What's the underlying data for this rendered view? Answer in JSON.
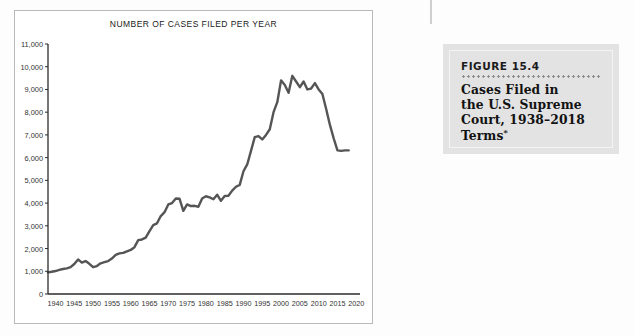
{
  "figure": {
    "number_label": "FIGURE 15.4",
    "title_line1": "Cases Filed in",
    "title_line2": "the U.S. Supreme",
    "title_line3": "Court, 1938–2018",
    "title_line4": "Terms",
    "title_footnote_marker": "*"
  },
  "colors": {
    "line": "#555555",
    "axis": "#2b2b2b",
    "card_bg": "#e3e3e3",
    "panel_border": "#b9b9b9",
    "text": "#1a1a1a"
  },
  "chart_data": {
    "type": "line",
    "title": "NUMBER OF CASES FILED PER YEAR",
    "xlabel": "",
    "ylabel": "",
    "xlim": [
      1938,
      2021
    ],
    "ylim": [
      0,
      11000
    ],
    "grid": false,
    "legend": "none",
    "ytick_labels": [
      "0",
      "1,000",
      "2,000",
      "3,000",
      "4,000",
      "5,000",
      "6,000",
      "7,000",
      "8,000",
      "9,000",
      "10,000",
      "11,000"
    ],
    "ytick_values": [
      0,
      1000,
      2000,
      3000,
      4000,
      5000,
      6000,
      7000,
      8000,
      9000,
      10000,
      11000
    ],
    "xtick_labels": [
      "1940",
      "1945",
      "1950",
      "1955",
      "1960",
      "1965",
      "1970",
      "1975",
      "1980",
      "1985",
      "1990",
      "1995",
      "2000",
      "2005",
      "2010",
      "2015",
      "2020"
    ],
    "xtick_values": [
      1940,
      1945,
      1950,
      1955,
      1960,
      1965,
      1970,
      1975,
      1980,
      1985,
      1990,
      1995,
      2000,
      2005,
      2010,
      2015,
      2020
    ],
    "series": [
      {
        "name": "Cases filed per year",
        "x": [
          1938,
          1939,
          1940,
          1941,
          1942,
          1943,
          1944,
          1945,
          1946,
          1947,
          1948,
          1949,
          1950,
          1951,
          1952,
          1953,
          1954,
          1955,
          1956,
          1957,
          1958,
          1959,
          1960,
          1961,
          1962,
          1963,
          1964,
          1965,
          1966,
          1967,
          1968,
          1969,
          1970,
          1971,
          1972,
          1973,
          1974,
          1975,
          1976,
          1977,
          1978,
          1979,
          1980,
          1981,
          1982,
          1983,
          1984,
          1985,
          1986,
          1987,
          1988,
          1989,
          1990,
          1991,
          1992,
          1993,
          1994,
          1995,
          1996,
          1997,
          1998,
          1999,
          2000,
          2001,
          2002,
          2003,
          2004,
          2005,
          2006,
          2007,
          2008,
          2009,
          2010,
          2011,
          2012,
          2013,
          2014,
          2015,
          2016,
          2017,
          2018
        ],
        "values": [
          950,
          980,
          1010,
          1060,
          1100,
          1130,
          1180,
          1320,
          1520,
          1380,
          1450,
          1330,
          1180,
          1230,
          1350,
          1400,
          1450,
          1560,
          1720,
          1790,
          1810,
          1880,
          1940,
          2060,
          2370,
          2400,
          2480,
          2770,
          3030,
          3110,
          3430,
          3600,
          3940,
          4000,
          4200,
          4190,
          3660,
          3940,
          3870,
          3880,
          3840,
          4200,
          4300,
          4250,
          4170,
          4370,
          4100,
          4310,
          4320,
          4550,
          4720,
          4800,
          5400,
          5700,
          6300,
          6900,
          6950,
          6800,
          7000,
          7250,
          8000,
          8440,
          9400,
          9200,
          8850,
          9600,
          9350,
          9100,
          9350,
          9000,
          9040,
          9280,
          9000,
          8800,
          8140,
          7440,
          6850,
          6320,
          6300,
          6320,
          6320
        ]
      }
    ],
    "annotations": {
      "max_value": 9600,
      "max_year": 2003,
      "min_value": 950,
      "min_year": 1938,
      "last_value": 6320,
      "last_year": 2018
    }
  }
}
